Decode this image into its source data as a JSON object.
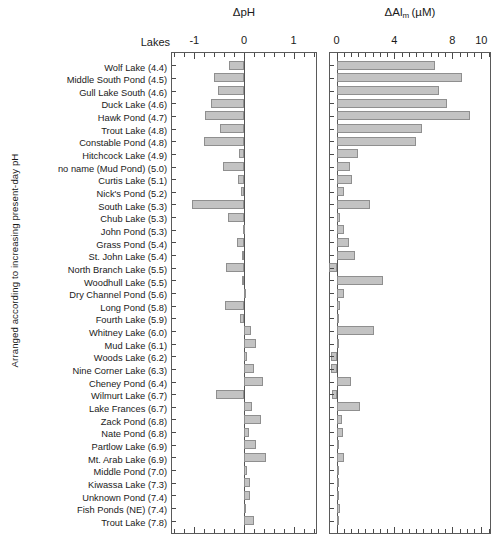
{
  "figure": {
    "y_axis_caption": "Arranged according to increasing present-day pH",
    "lakes_header": "Lakes"
  },
  "chart_data": {
    "type": "bar",
    "orientation": "horizontal",
    "title": "",
    "ylabel": "Arranged according to increasing present-day pH",
    "grid": false,
    "legend": false,
    "categories": [
      "Wolf Lake (4.4)",
      "Middle South Pond (4.5)",
      "Gull Lake South (4.6)",
      "Duck Lake (4.6)",
      "Hawk Pond (4.7)",
      "Trout Lake (4.8)",
      "Constable Pond (4.8)",
      "Hitchcock Lake (4.9)",
      "no name (Mud Pond) (5.0)",
      "Curtis Lake (5.1)",
      "Nick's Pond (5.2)",
      "South Lake (5.3)",
      "Chub Lake (5.3)",
      "John Pond (5.3)",
      "Grass Pond (5.4)",
      "St. John Lake (5.4)",
      "North Branch Lake (5.5)",
      "Woodhull Lake (5.5)",
      "Dry Channel Pond (5.6)",
      "Long Pond (5.8)",
      "Fourth Lake (5.9)",
      "Whitney Lake (6.0)",
      "Mud Lake (6.1)",
      "Woods Lake (6.2)",
      "Nine Corner Lake (6.3)",
      "Cheney Pond (6.4)",
      "Wilmurt Lake (6.7)",
      "Lake Frances (6.7)",
      "Zack Pond (6.8)",
      "Nate Pond (6.8)",
      "Partlow Lake (6.9)",
      "Mt. Arab Lake (6.9)",
      "Middle Pond (7.0)",
      "Kiwassa Lake (7.3)",
      "Unknown Pond (7.4)",
      "Fish Ponds (NE) (7.4)",
      "Trout Lake (7.8)"
    ],
    "panels": [
      {
        "id": "ph",
        "xlabel": "ΔpH",
        "xlabel_main": "ΔpH",
        "xlabel_sub": "",
        "xlabel_unit": "",
        "xlim": [
          -1.45,
          1.45
        ],
        "xticks": [
          -1,
          0,
          1
        ],
        "xticklabels": [
          "-1",
          "0",
          "1"
        ],
        "minor_tick_step": 0.2,
        "values": [
          -0.3,
          -0.6,
          -0.53,
          -0.66,
          -0.78,
          -0.48,
          -0.8,
          -0.1,
          -0.43,
          -0.13,
          -0.06,
          -1.05,
          -0.32,
          -0.02,
          -0.15,
          -0.05,
          -0.37,
          -0.04,
          0.0,
          -0.38,
          -0.08,
          0.14,
          0.25,
          0.07,
          0.21,
          0.38,
          -0.56,
          0.17,
          0.34,
          0.1,
          0.24,
          0.44,
          0.07,
          0.12,
          0.13,
          0.01,
          0.2
        ]
      },
      {
        "id": "al",
        "xlabel": "ΔAl_m (µM)",
        "xlabel_main": "ΔAl",
        "xlabel_sub": "m",
        "xlabel_unit": "(µM)",
        "xlim": [
          -0.45,
          10.6
        ],
        "xticks": [
          0,
          4,
          8,
          10
        ],
        "xticklabels": [
          "0",
          "4",
          "8",
          "10"
        ],
        "minor_tick_step": 0.5,
        "values": [
          6.8,
          8.7,
          7.1,
          7.6,
          9.2,
          5.9,
          5.5,
          1.5,
          0.9,
          1.1,
          0.5,
          2.3,
          0.25,
          0.55,
          0.85,
          1.3,
          -0.55,
          3.2,
          0.55,
          0.25,
          0.05,
          2.6,
          0.2,
          -0.35,
          -0.35,
          1.0,
          -0.3,
          1.6,
          0.35,
          0.45,
          0.15,
          0.5,
          0.1,
          0.1,
          0.12,
          0.25,
          0.2
        ]
      }
    ]
  },
  "style": {
    "bar_fill": "#c3c3c3",
    "bar_edge": "#8f8f8f",
    "axis_color": "#5a5a5a",
    "text_color": "#1a1a1a"
  }
}
